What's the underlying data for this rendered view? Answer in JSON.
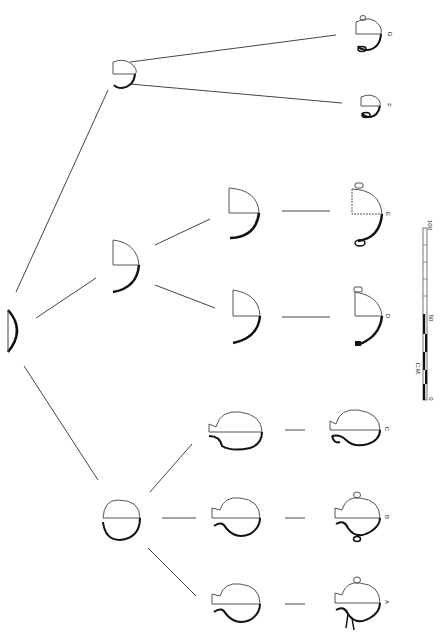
{
  "figure": {
    "type": "pottery-typology-tree",
    "orientation": "rotated-90",
    "line_color": "#333333",
    "thick_color": "#111111"
  },
  "nodes": {
    "root": {
      "label": ""
    },
    "branch_top": {
      "label": ""
    },
    "branch_mid": {
      "label": ""
    },
    "branch_bottom": {
      "label": ""
    },
    "mid_upper": {
      "label": ""
    },
    "mid_lower": {
      "label": ""
    },
    "bot_c": {
      "label": ""
    },
    "bot_b": {
      "label": ""
    },
    "bot_a": {
      "label": ""
    }
  },
  "vessels": [
    {
      "id": "G",
      "label": "G"
    },
    {
      "id": "F",
      "label": "F"
    },
    {
      "id": "E",
      "label": "E"
    },
    {
      "id": "D",
      "label": "D"
    },
    {
      "id": "C",
      "label": "C"
    },
    {
      "id": "B",
      "label": "B"
    },
    {
      "id": "A",
      "label": "A"
    }
  ],
  "scale_bar": {
    "unit": "C.M.",
    "ticks": [
      "0",
      "50",
      "100"
    ]
  }
}
